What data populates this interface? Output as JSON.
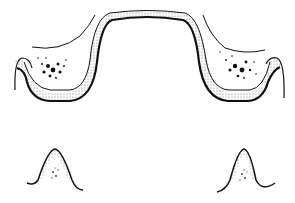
{
  "figure": {
    "type": "anatomical line drawing",
    "panels": [
      {
        "name": "upper-arch-cross-section",
        "description": "Broad arch cross-section with stippled layer and two dotted cancellous regions"
      },
      {
        "name": "lower-left-ridge",
        "description": "Small ridge cross-section with stippled cap"
      },
      {
        "name": "lower-right-ridge",
        "description": "Small ridge cross-section with stippled cap"
      }
    ],
    "colors": {
      "ink": "#111111",
      "background": "#ffffff",
      "stipple": "#555555"
    }
  }
}
